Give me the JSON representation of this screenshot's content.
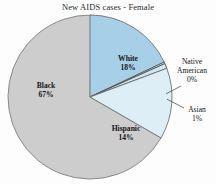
{
  "chart_data": {
    "type": "pie",
    "title": "New AIDS cases - Female",
    "xlabel": "",
    "ylabel": "",
    "legend": "none",
    "grid": false,
    "categories": [
      "White",
      "Native American",
      "Asian",
      "Hispanic",
      "Black"
    ],
    "values": [
      18,
      0,
      1,
      14,
      67
    ],
    "labels": [
      "18%",
      "0%",
      "1%",
      "14%",
      "67%"
    ],
    "colors": [
      "#a8cfe8",
      "#e8f4fb",
      "#cfe7f4",
      "#ddeef7",
      "#cdcdcd"
    ],
    "slices": [
      {
        "name": "White",
        "value": 18,
        "label": "White",
        "pct": "18%",
        "color": "#a8cfe8",
        "callout": false
      },
      {
        "name": "Native American",
        "value": 0,
        "label": "Native American",
        "pct": "0%",
        "color": "#e8f4fb",
        "callout": true
      },
      {
        "name": "Asian",
        "value": 1,
        "label": "Asian",
        "pct": "1%",
        "color": "#cfe7f4",
        "callout": true
      },
      {
        "name": "Hispanic",
        "value": 14,
        "label": "Hispanic",
        "pct": "14%",
        "color": "#ddeef7",
        "callout": false
      },
      {
        "name": "Black",
        "value": 67,
        "label": "Black",
        "pct": "67%",
        "color": "#cdcdcd",
        "callout": false
      }
    ]
  },
  "labels": {
    "white_name": "White",
    "white_pct": "18%",
    "black_name": "Black",
    "black_pct": "67%",
    "hispanic_name": "Hispanic",
    "hispanic_pct": "14%",
    "native_line1": "Native",
    "native_line2": "American",
    "native_pct": "0%",
    "asian_name": "Asian",
    "asian_pct": "1%"
  },
  "style": {
    "background": "#fdfdfd",
    "outline": "#6f6f6f",
    "text": "#151515"
  }
}
